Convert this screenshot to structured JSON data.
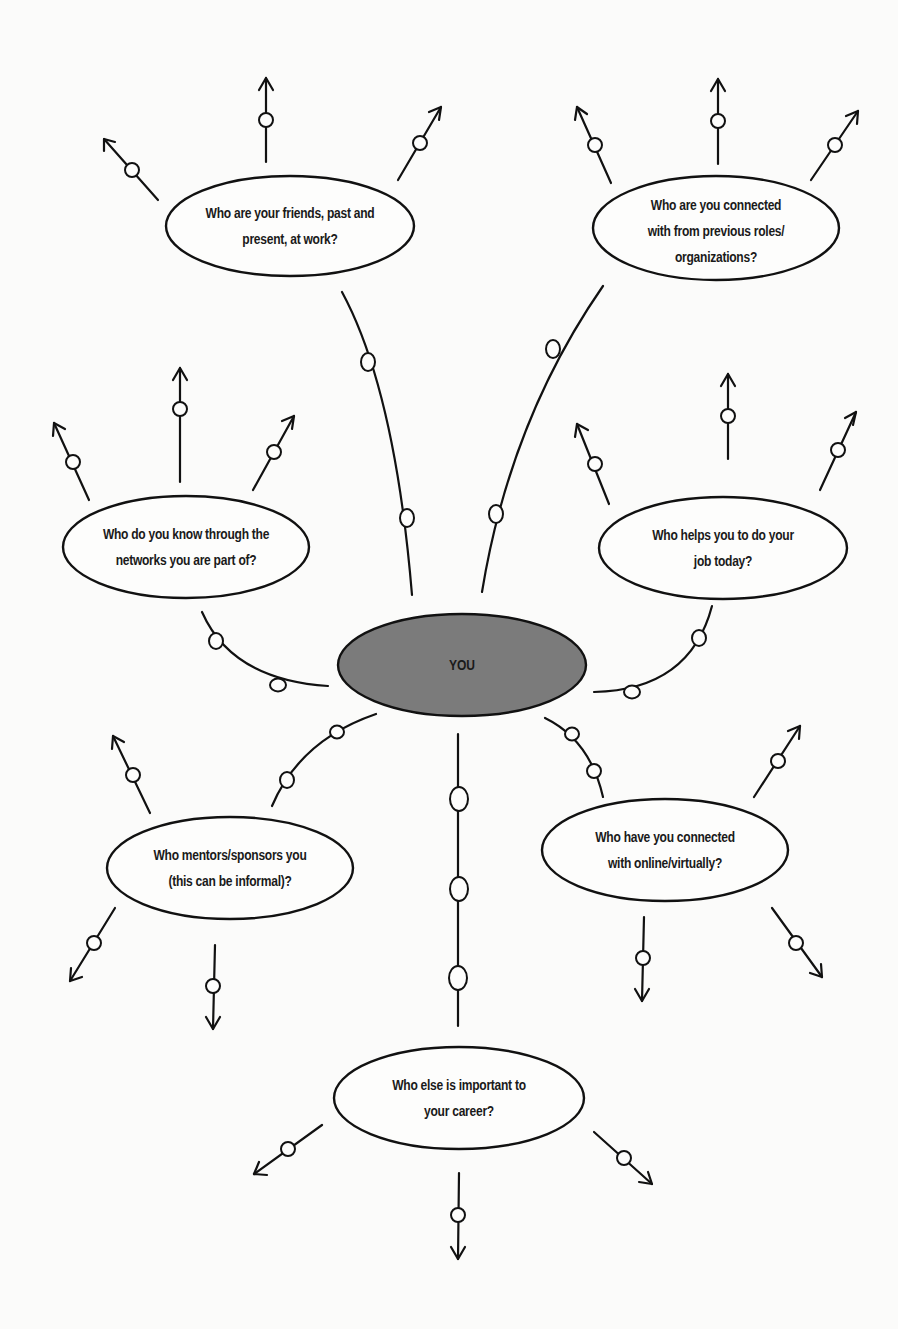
{
  "diagram": {
    "type": "network-map",
    "colors": {
      "background": "#fbfbfa",
      "stroke": "#111111",
      "center_fill": "#7b7b7b",
      "node_fill": "#fdfdfc"
    },
    "center": {
      "label": "YOU"
    },
    "nodes": [
      {
        "id": "friends",
        "lines": [
          "Who are your friends, past and",
          "present, at work?"
        ]
      },
      {
        "id": "previous-roles",
        "lines": [
          "Who are you connected",
          "with from previous roles/",
          "organizations?"
        ]
      },
      {
        "id": "networks",
        "lines": [
          "Who do you know through the",
          "networks you are part of?"
        ]
      },
      {
        "id": "helps-job",
        "lines": [
          "Who helps you to do your",
          "job today?"
        ]
      },
      {
        "id": "mentors",
        "lines": [
          "Who mentors/sponsors you",
          "(this can be informal)?"
        ]
      },
      {
        "id": "online",
        "lines": [
          "Who have you connected",
          "with online/virtually?"
        ]
      },
      {
        "id": "else-important",
        "lines": [
          "Who else is important to",
          "your career?"
        ]
      }
    ]
  }
}
